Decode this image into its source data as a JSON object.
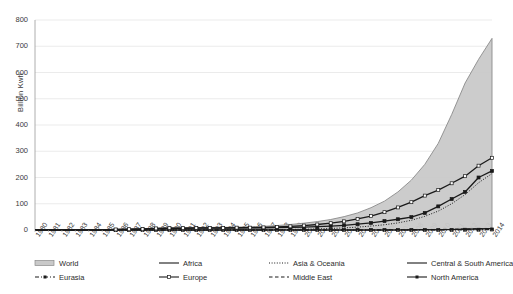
{
  "axis": {
    "ylabel": "Billion Kwh",
    "yticks": [
      "0",
      "100",
      "200",
      "300",
      "400",
      "500",
      "600",
      "700",
      "800"
    ],
    "xticks": [
      "1980",
      "1981",
      "1982",
      "1983",
      "1984",
      "1985",
      "1986",
      "1987",
      "1988",
      "1989",
      "1990",
      "1991",
      "1992",
      "1993",
      "1994",
      "1995",
      "1996",
      "1997",
      "1998",
      "1999",
      "2000",
      "2001",
      "2002",
      "2003",
      "2004",
      "2005",
      "2006",
      "2007",
      "2008",
      "2009",
      "2010",
      "2011",
      "2012",
      "2013",
      "2014"
    ]
  },
  "legend": {
    "items": [
      {
        "label": "World",
        "style": "area"
      },
      {
        "label": "Africa",
        "style": "solid"
      },
      {
        "label": "Asia & Oceania",
        "style": "dotted"
      },
      {
        "label": "Central & South America",
        "style": "solid"
      },
      {
        "label": "Eurasia",
        "style": "dashdot-marker"
      },
      {
        "label": "Europe",
        "style": "line-open-marker"
      },
      {
        "label": "Middle East",
        "style": "dashed"
      },
      {
        "label": "North America",
        "style": "line-filled-marker"
      }
    ]
  },
  "colors": {
    "area_fill": "#c9c9c9",
    "area_stroke": "#8a8a8a",
    "line": "#1a1a1a",
    "grid": "#e3e3e3",
    "axis": "#9a9a9a",
    "text": "#333333"
  },
  "chart_data": {
    "type": "area",
    "title": "",
    "xlabel": "",
    "ylabel": "Billion Kwh",
    "xlim": [
      1980,
      2014
    ],
    "ylim": [
      0,
      800
    ],
    "ytick_step": 100,
    "grid": true,
    "legend_position": "bottom",
    "x": [
      1980,
      1981,
      1982,
      1983,
      1984,
      1985,
      1986,
      1987,
      1988,
      1989,
      1990,
      1991,
      1992,
      1993,
      1994,
      1995,
      1996,
      1997,
      1998,
      1999,
      2000,
      2001,
      2002,
      2003,
      2004,
      2005,
      2006,
      2007,
      2008,
      2009,
      2010,
      2011,
      2012,
      2013,
      2014
    ],
    "series": [
      {
        "name": "World",
        "style": "area",
        "values": [
          0,
          0,
          0,
          0,
          0,
          0,
          3,
          4,
          5,
          7,
          8,
          9,
          9,
          10,
          10,
          11,
          12,
          14,
          17,
          21,
          26,
          32,
          40,
          51,
          65,
          85,
          110,
          145,
          190,
          250,
          330,
          440,
          560,
          650,
          730
        ]
      },
      {
        "name": "Europe",
        "style": "line-open-marker",
        "values": [
          0,
          0,
          0,
          0,
          0,
          0,
          2,
          3,
          4,
          6,
          7,
          7,
          8,
          8,
          8,
          9,
          9,
          10,
          12,
          14,
          17,
          21,
          26,
          33,
          42,
          53,
          68,
          86,
          106,
          131,
          152,
          178,
          205,
          245,
          275
        ]
      },
      {
        "name": "North America",
        "style": "line-filled-marker",
        "values": [
          0,
          0,
          0,
          0,
          0,
          0,
          1,
          2,
          3,
          5,
          6,
          6,
          7,
          7,
          7,
          7,
          8,
          8,
          9,
          10,
          11,
          13,
          15,
          18,
          22,
          27,
          34,
          41,
          49,
          65,
          90,
          118,
          145,
          200,
          225
        ]
      },
      {
        "name": "Asia & Oceania",
        "style": "dotted",
        "values": [
          0,
          0,
          0,
          0,
          0,
          0,
          0,
          0,
          0,
          0,
          0,
          0,
          0,
          0,
          0,
          1,
          1,
          1,
          2,
          2,
          3,
          4,
          6,
          8,
          11,
          15,
          20,
          27,
          37,
          52,
          72,
          100,
          135,
          180,
          215
        ]
      },
      {
        "name": "Middle East",
        "style": "dashed",
        "values": [
          0,
          0,
          0,
          0,
          0,
          0,
          0,
          0,
          0,
          0,
          0,
          0,
          0,
          0,
          0,
          0,
          0,
          0,
          0,
          0,
          0,
          0,
          0,
          0,
          0,
          0,
          1,
          1,
          1,
          2,
          2,
          3,
          4,
          5,
          6
        ]
      },
      {
        "name": "Africa",
        "style": "solid",
        "values": [
          0,
          0,
          0,
          0,
          0,
          0,
          0,
          0,
          0,
          0,
          0,
          0,
          0,
          0,
          0,
          0,
          0,
          0,
          0,
          0,
          0,
          0,
          0,
          0,
          0,
          0,
          0,
          0,
          1,
          1,
          1,
          2,
          3,
          4,
          5
        ]
      },
      {
        "name": "Central & South America",
        "style": "solid",
        "values": [
          0,
          0,
          0,
          0,
          0,
          0,
          0,
          0,
          0,
          0,
          0,
          0,
          0,
          0,
          0,
          0,
          0,
          0,
          0,
          0,
          0,
          0,
          0,
          0,
          0,
          0,
          0,
          0,
          0,
          1,
          1,
          2,
          3,
          4,
          6
        ]
      },
      {
        "name": "Eurasia",
        "style": "dashdot-marker",
        "values": [
          0,
          0,
          0,
          0,
          0,
          0,
          0,
          0,
          0,
          0,
          0,
          0,
          0,
          0,
          0,
          0,
          0,
          0,
          0,
          0,
          0,
          0,
          0,
          0,
          0,
          0,
          0,
          0,
          0,
          0,
          0,
          0,
          1,
          1,
          2
        ]
      }
    ]
  }
}
